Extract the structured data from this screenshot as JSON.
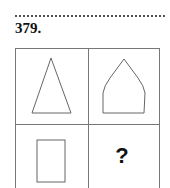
{
  "header": {
    "puzzle_number": "379."
  },
  "grid": {
    "rows": 2,
    "columns": 2,
    "cells": [
      {
        "position": "top-left",
        "shape": "triangle"
      },
      {
        "position": "top-right",
        "shape": "pointed-dome"
      },
      {
        "position": "bottom-left",
        "shape": "rectangle"
      },
      {
        "position": "bottom-right",
        "shape": "unknown",
        "label": "?"
      }
    ],
    "line_color": "#777777",
    "shape_stroke_color": "#666666"
  }
}
